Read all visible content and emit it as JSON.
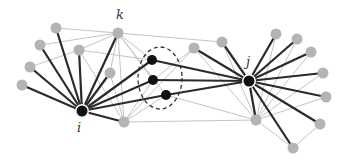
{
  "diagram": {
    "labels": {
      "i": "i",
      "j": "j",
      "k": "k"
    },
    "colors": {
      "hub": "#111111",
      "node": "#b4b4b4",
      "strong_edge": "#2a2a2a",
      "weak_edge": "#c4c4c4",
      "ellipse": "#333333"
    },
    "hubs": [
      {
        "id": "i",
        "x": 82,
        "y": 111,
        "r": 5.5
      },
      {
        "id": "j",
        "x": 249,
        "y": 81,
        "r": 5.5
      }
    ],
    "middle_nodes": [
      {
        "id": "m1",
        "x": 152,
        "y": 60,
        "r": 5
      },
      {
        "id": "m2",
        "x": 153,
        "y": 80,
        "r": 5
      },
      {
        "id": "m3",
        "x": 166,
        "y": 95,
        "r": 5
      }
    ],
    "nodes": [
      {
        "id": "a1",
        "x": 56,
        "y": 28
      },
      {
        "id": "a2",
        "x": 40,
        "y": 45
      },
      {
        "id": "a3",
        "x": 30,
        "y": 67
      },
      {
        "id": "a4",
        "x": 22,
        "y": 85
      },
      {
        "id": "a5",
        "x": 79,
        "y": 50
      },
      {
        "id": "k",
        "x": 118,
        "y": 33
      },
      {
        "id": "a6",
        "x": 110,
        "y": 73
      },
      {
        "id": "b0",
        "x": 124,
        "y": 122
      },
      {
        "id": "c1",
        "x": 194,
        "y": 48
      },
      {
        "id": "c2",
        "x": 222,
        "y": 42
      },
      {
        "id": "c3",
        "x": 256,
        "y": 120
      },
      {
        "id": "d1",
        "x": 276,
        "y": 34
      },
      {
        "id": "d2",
        "x": 297,
        "y": 39
      },
      {
        "id": "d3",
        "x": 311,
        "y": 52
      },
      {
        "id": "d4",
        "x": 323,
        "y": 73
      },
      {
        "id": "d5",
        "x": 326,
        "y": 97
      },
      {
        "id": "d6",
        "x": 320,
        "y": 124
      },
      {
        "id": "d7",
        "x": 293,
        "y": 148
      }
    ],
    "strong_edges": [
      [
        "i",
        "a1"
      ],
      [
        "i",
        "a2"
      ],
      [
        "i",
        "a3"
      ],
      [
        "i",
        "a4"
      ],
      [
        "i",
        "a5"
      ],
      [
        "i",
        "k"
      ],
      [
        "i",
        "a6"
      ],
      [
        "i",
        "b0"
      ],
      [
        "i",
        "m1"
      ],
      [
        "i",
        "m2"
      ],
      [
        "i",
        "m3"
      ],
      [
        "j",
        "m1"
      ],
      [
        "j",
        "m2"
      ],
      [
        "j",
        "m3"
      ],
      [
        "j",
        "c1"
      ],
      [
        "j",
        "c2"
      ],
      [
        "j",
        "c3"
      ],
      [
        "j",
        "d1"
      ],
      [
        "j",
        "d2"
      ],
      [
        "j",
        "d3"
      ],
      [
        "j",
        "d4"
      ],
      [
        "j",
        "d5"
      ],
      [
        "j",
        "d6"
      ],
      [
        "j",
        "d7"
      ]
    ],
    "weak_edges": [
      [
        "a1",
        "k"
      ],
      [
        "a2",
        "k"
      ],
      [
        "a3",
        "a5"
      ],
      [
        "a5",
        "k"
      ],
      [
        "k",
        "c2"
      ],
      [
        "k",
        "a6"
      ],
      [
        "k",
        "b0"
      ],
      [
        "k",
        "m1"
      ],
      [
        "k",
        "m2"
      ],
      [
        "a5",
        "b0"
      ],
      [
        "a5",
        "m1"
      ],
      [
        "a6",
        "b0"
      ],
      [
        "k",
        "m3"
      ],
      [
        "b0",
        "c1"
      ],
      [
        "b0",
        "c3"
      ],
      [
        "b0",
        "m3"
      ],
      [
        "b0",
        "m2"
      ],
      [
        "m3",
        "c3"
      ],
      [
        "c1",
        "c3"
      ],
      [
        "c2",
        "c3"
      ],
      [
        "c1",
        "m2"
      ],
      [
        "c3",
        "d1"
      ],
      [
        "c3",
        "d2"
      ],
      [
        "c3",
        "d3"
      ],
      [
        "c3",
        "d4"
      ],
      [
        "c3",
        "d5"
      ],
      [
        "c3",
        "d7"
      ],
      [
        "d6",
        "d7"
      ]
    ],
    "ellipse": {
      "cx": 160,
      "cy": 78,
      "rx": 22,
      "ry": 31
    },
    "label_positions": {
      "i": {
        "x": 77,
        "y": 132
      },
      "j": {
        "x": 246,
        "y": 66
      },
      "k": {
        "x": 116,
        "y": 19
      }
    }
  }
}
